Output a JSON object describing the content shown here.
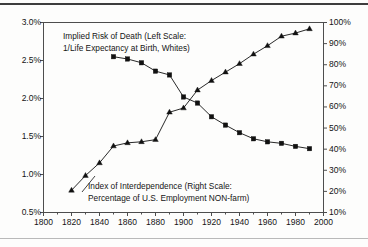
{
  "figure": {
    "background_color": "#fdfdfc",
    "frame_color": "#4d4d4d",
    "series_color": "#111111"
  },
  "annotations": {
    "death_line1": "Implied Risk of Death (Left Scale:",
    "death_line2": "1/Life Expectancy at Birth, Whites)",
    "interdep_line1": "Index of Interdependence (Right Scale:",
    "interdep_line2": "Percentage of U.S. Employment NON-farm)"
  },
  "axes": {
    "left_ticks": [
      "3.0%",
      "2.5%",
      "2.0%",
      "1.5%",
      "1.0%",
      "0.5%"
    ],
    "right_ticks": [
      "100%",
      "90%",
      "80%",
      "70%",
      "60%",
      "50%",
      "40%",
      "30%",
      "20%",
      "10%"
    ],
    "x_ticks": [
      "1800",
      "1820",
      "1840",
      "1860",
      "1880",
      "1900",
      "1920",
      "1940",
      "1960",
      "1980",
      "2000"
    ]
  },
  "chart_data": {
    "type": "line",
    "title": "",
    "subtitle": "",
    "xlabel": "",
    "ylabel": "Implied Risk of Death (1/Life Expectancy at Birth, Whites)",
    "y2label": "Index of Interdependence (Percentage of U.S. Employment NON-farm)",
    "xlim": [
      1800,
      2000
    ],
    "ylim": [
      0.5,
      3.0
    ],
    "y2lim": [
      10,
      100
    ],
    "ytick_values": [
      3.0,
      2.5,
      2.0,
      1.5,
      1.0,
      0.5
    ],
    "y2tick_values": [
      100,
      90,
      80,
      70,
      60,
      50,
      40,
      30,
      20,
      10
    ],
    "xtick_values": [
      1800,
      1820,
      1840,
      1860,
      1880,
      1900,
      1920,
      1940,
      1960,
      1980,
      2000
    ],
    "x_minor_tick_interval": 10,
    "grid": false,
    "legend": "in-plot text annotations",
    "series": [
      {
        "name": "Implied Risk of Death (Left Scale: 1/Life Expectancy at Birth, Whites)",
        "axis": "left",
        "units": "percent",
        "marker": "square",
        "x": [
          1850,
          1860,
          1870,
          1880,
          1890,
          1900,
          1910,
          1920,
          1930,
          1940,
          1950,
          1960,
          1970,
          1980,
          1990
        ],
        "values": [
          2.55,
          2.52,
          2.47,
          2.36,
          2.31,
          2.02,
          1.94,
          1.76,
          1.65,
          1.55,
          1.47,
          1.43,
          1.41,
          1.37,
          1.34
        ]
      },
      {
        "name": "Index of Interdependence (Right Scale: Percentage of U.S. Employment NON-farm)",
        "axis": "right",
        "units": "percent",
        "marker": "triangle",
        "x": [
          1820,
          1830,
          1840,
          1850,
          1860,
          1870,
          1880,
          1890,
          1900,
          1910,
          1920,
          1930,
          1940,
          1950,
          1960,
          1970,
          1980,
          1990
        ],
        "values": [
          20.5,
          27.5,
          33.5,
          41.5,
          43.0,
          43.5,
          44.5,
          57.5,
          59.5,
          68.0,
          72.5,
          76.5,
          80.5,
          85.0,
          89.0,
          93.5,
          95.0,
          97.0
        ]
      }
    ]
  }
}
